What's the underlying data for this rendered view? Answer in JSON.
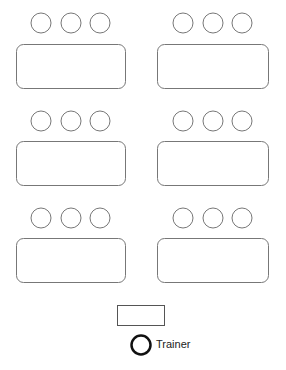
{
  "diagram": {
    "groups": [
      {
        "id": "group-1",
        "seats": 3,
        "pos": "top-left"
      },
      {
        "id": "group-2",
        "seats": 3,
        "pos": "top-right"
      },
      {
        "id": "group-3",
        "seats": 3,
        "pos": "middle-left"
      },
      {
        "id": "group-4",
        "seats": 3,
        "pos": "middle-right"
      },
      {
        "id": "group-5",
        "seats": 3,
        "pos": "bottom-left"
      },
      {
        "id": "group-6",
        "seats": 3,
        "pos": "bottom-right"
      }
    ],
    "trainer_desk": true,
    "trainer_label": "Trainer",
    "colors": {
      "outline": "#777777",
      "trainer": "#111111"
    }
  }
}
